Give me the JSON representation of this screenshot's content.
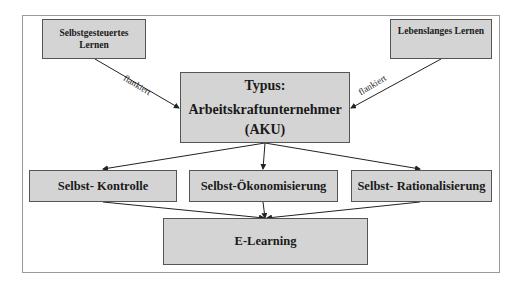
{
  "diagram": {
    "nodes": {
      "self_directed": {
        "label_line1": "Selbstgesteuertes",
        "label_line2": "Lernen"
      },
      "lifelong": {
        "label": "Lebenslanges Lernen"
      },
      "center": {
        "line1": "Typus:",
        "line2": "Arbeitskraftunternehmer",
        "line3": "(AKU)"
      },
      "control": {
        "label": "Selbst- Kontrolle"
      },
      "economization": {
        "label": "Selbst-Ökonomisierung"
      },
      "rationalization": {
        "label": "Selbst- Rationalisierung"
      },
      "elearning": {
        "label": "E-Learning"
      }
    },
    "edges": [
      {
        "from": "self_directed",
        "to": "center",
        "label": "flankiert"
      },
      {
        "from": "lifelong",
        "to": "center",
        "label": "flankiert"
      },
      {
        "from": "center",
        "to": "control",
        "label": ""
      },
      {
        "from": "center",
        "to": "economization",
        "label": ""
      },
      {
        "from": "center",
        "to": "rationalization",
        "label": ""
      },
      {
        "from": "control",
        "to": "elearning",
        "label": ""
      },
      {
        "from": "economization",
        "to": "elearning",
        "label": ""
      },
      {
        "from": "rationalization",
        "to": "elearning",
        "label": ""
      }
    ],
    "colors": {
      "box_fill": "#d4d4d4",
      "box_border": "#555555",
      "frame_border": "#9a9a9a"
    }
  }
}
